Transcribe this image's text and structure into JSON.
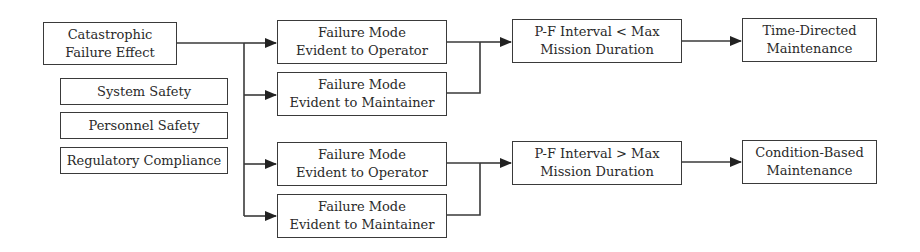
{
  "diagram": {
    "type": "flowchart",
    "source_node": {
      "line1": "Catastrophic",
      "line2": "Failure Effect"
    },
    "criteria": [
      {
        "label": "System Safety"
      },
      {
        "label": "Personnel Safety"
      },
      {
        "label": "Regulatory Compliance"
      }
    ],
    "branch_top": {
      "modes": [
        {
          "line1": "Failure Mode",
          "line2": "Evident to Operator"
        },
        {
          "line1": "Failure Mode",
          "line2": "Evident to Maintainer"
        }
      ],
      "condition": {
        "line1": "P-F Interval < Max",
        "line2": "Mission Duration"
      },
      "outcome": {
        "line1": "Time-Directed",
        "line2": "Maintenance"
      }
    },
    "branch_bottom": {
      "modes": [
        {
          "line1": "Failure Mode",
          "line2": "Evident to Operator"
        },
        {
          "line1": "Failure Mode",
          "line2": "Evident to Maintainer"
        }
      ],
      "condition": {
        "line1": "P-F Interval > Max",
        "line2": "Mission Duration"
      },
      "outcome": {
        "line1": "Condition-Based",
        "line2": "Maintenance"
      }
    },
    "colors": {
      "stroke": "#3a3a3a",
      "text": "#2a2a2a",
      "background": "#ffffff"
    }
  }
}
